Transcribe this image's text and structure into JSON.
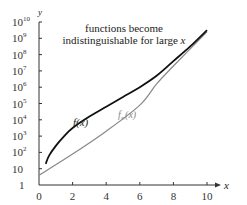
{
  "chart_data": {
    "type": "line",
    "title": "",
    "xlabel": "x",
    "ylabel": "y",
    "xlim": [
      0,
      10
    ],
    "ylim_log10": [
      0,
      10
    ],
    "yscale": "log",
    "grid": false,
    "x_ticks": [
      "0",
      "2",
      "4",
      "6",
      "8",
      "10"
    ],
    "y_ticks": [
      "1",
      "10",
      "10^2",
      "10^3",
      "10^4",
      "10^5",
      "10^6",
      "10^7",
      "10^8",
      "10^9",
      "10^10"
    ],
    "annotation": "functions become indistinguishable for large x",
    "series": [
      {
        "name": "f(x)",
        "color": "#111111",
        "x": [
          0.4,
          0.6,
          1.0,
          1.5,
          2.0,
          3.0,
          4.0,
          5.0,
          6.0,
          7.0,
          8.0,
          9.0,
          10.0
        ],
        "log10_y": [
          1.3,
          1.8,
          2.4,
          3.0,
          3.5,
          4.2,
          4.8,
          5.4,
          6.0,
          6.7,
          7.6,
          8.5,
          9.5
        ]
      },
      {
        "name": "f∞(x)",
        "color": "#888888",
        "x": [
          0,
          2,
          4,
          6,
          7,
          8,
          10
        ],
        "log10_y": [
          0.6,
          1.9,
          3.3,
          4.9,
          6.2,
          7.3,
          9.4
        ]
      }
    ]
  },
  "labels": {
    "annotation_line1": "functions become",
    "annotation_line2_prefix": "indistinguishable for large ",
    "annotation_line2_var": "x",
    "f_label": "f(x)",
    "finf_label_f": "f",
    "finf_label_sub": "∞",
    "finf_label_arg": "(x)",
    "x_axis_label": "x",
    "y_axis_label": "y",
    "x_ticks": [
      "0",
      "2",
      "4",
      "6",
      "8",
      "10"
    ],
    "y_ticks": [
      {
        "base": "1",
        "exp": ""
      },
      {
        "base": "10",
        "exp": ""
      },
      {
        "base": "10",
        "exp": "2"
      },
      {
        "base": "10",
        "exp": "3"
      },
      {
        "base": "10",
        "exp": "4"
      },
      {
        "base": "10",
        "exp": "5"
      },
      {
        "base": "10",
        "exp": "6"
      },
      {
        "base": "10",
        "exp": "7"
      },
      {
        "base": "10",
        "exp": "8"
      },
      {
        "base": "10",
        "exp": "9"
      },
      {
        "base": "10",
        "exp": "10"
      }
    ]
  }
}
